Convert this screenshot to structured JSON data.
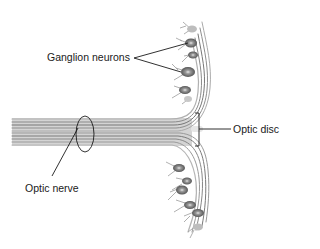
{
  "diagram": {
    "labels": {
      "ganglion_neurons": "Ganglion neurons",
      "optic_disc": "Optic disc",
      "optic_nerve": "Optic nerve"
    },
    "colors": {
      "background": "#ffffff",
      "fibers": "#7a7a7a",
      "fibers_light": "#b5b5b5",
      "neuron_body": "#6e6e6e",
      "leader_lines": "#1a1a1a",
      "text": "#1a1a1a"
    }
  }
}
